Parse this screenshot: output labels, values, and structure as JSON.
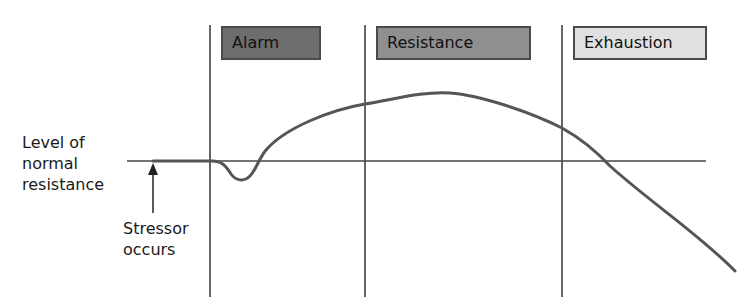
{
  "diagram": {
    "stages": [
      {
        "label": "Alarm",
        "fill": "#6d6d6d"
      },
      {
        "label": "Resistance",
        "fill": "#8f8f8f"
      },
      {
        "label": "Exhaustion",
        "fill": "#e0e0e0"
      }
    ],
    "baseline_label": {
      "line1": "Level of",
      "line2": "normal",
      "line3": "resistance"
    },
    "stressor_label": {
      "line1": "Stressor",
      "line2": "occurs"
    },
    "colors": {
      "line": "#333333",
      "curve": "#555555",
      "box_border": "#4a4a4a"
    }
  }
}
